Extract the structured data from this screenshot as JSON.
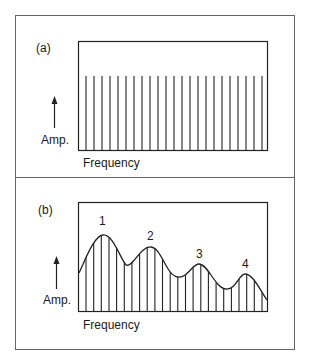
{
  "figure": {
    "panels": [
      {
        "id": "a",
        "label": "(a)",
        "y_axis_label": "Amp.",
        "x_axis_label": "Frequency",
        "description": "Uniform line spectrum - equal amplitude harmonics",
        "line_count": 23
      },
      {
        "id": "b",
        "label": "(b)",
        "y_axis_label": "Amp.",
        "x_axis_label": "Frequency",
        "description": "Line spectrum shaped by formant envelope",
        "line_count": 24,
        "peaks": [
          "1",
          "2",
          "3",
          "4"
        ]
      }
    ]
  },
  "colors": {
    "ink": "#1a1a1a",
    "frame": "#555555",
    "background": "#ffffff"
  }
}
